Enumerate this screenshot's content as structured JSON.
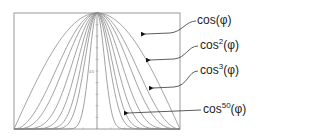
{
  "diagram": {
    "center_tick_label": "0.5",
    "exponents": [
      1,
      2,
      3,
      5,
      8,
      13,
      20,
      50
    ],
    "labels": [
      {
        "base": "cos",
        "exp": "",
        "arg": "(φ)",
        "exponent": 1
      },
      {
        "base": "cos",
        "exp": "2",
        "arg": "(φ)",
        "exponent": 2
      },
      {
        "base": "cos",
        "exp": "3",
        "arg": "(φ)",
        "exponent": 3
      },
      {
        "base": "cos",
        "exp": "50",
        "arg": "(φ)",
        "exponent": 50
      }
    ],
    "colors": {
      "curve": "#8a8a8a",
      "frame": "#9a9a9a",
      "arrow": "#111111"
    }
  }
}
